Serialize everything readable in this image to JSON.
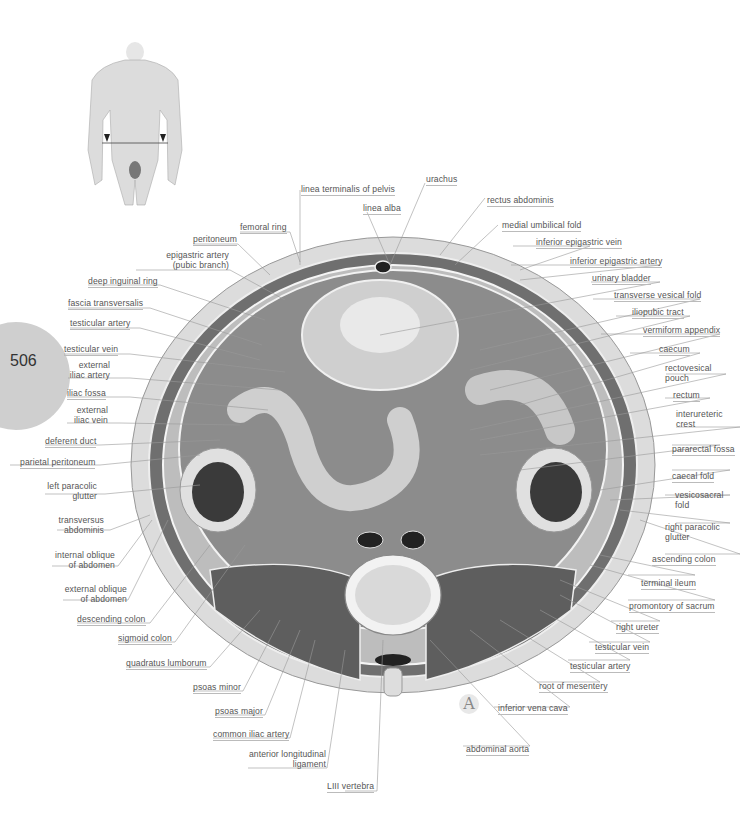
{
  "page": {
    "number": "506",
    "plate_letter": "A"
  },
  "figure": {
    "orientation_figure": "male torso with section line and arrows at lower abdomen"
  },
  "labels_left": [
    {
      "id": "femoral-ring",
      "text": "femoral ring"
    },
    {
      "id": "peritoneum",
      "text": "peritoneum"
    },
    {
      "id": "epigastric-artery",
      "text": "epigastric artery",
      "text2": "(pubic branch)"
    },
    {
      "id": "deep-inguinal-ring",
      "text": "deep inguinal ring"
    },
    {
      "id": "fascia-transversalis",
      "text": "fascia transversalis"
    },
    {
      "id": "testicular-artery-l",
      "text": "testicular artery"
    },
    {
      "id": "testicular-vein-l",
      "text": "testicular vein"
    },
    {
      "id": "external-iliac-artery",
      "text": "external",
      "text2": "iliac artery"
    },
    {
      "id": "iliac-fossa",
      "text": "iliac fossa"
    },
    {
      "id": "external-iliac-vein",
      "text": "external",
      "text2": "iliac vein"
    },
    {
      "id": "deferent-duct",
      "text": "deferent duct"
    },
    {
      "id": "parietal-peritoneum",
      "text": "parietal peritoneum"
    },
    {
      "id": "left-paracolic-glutter",
      "text": "left paracolic",
      "text2": "glutter"
    },
    {
      "id": "transversus-abdominis",
      "text": "transversus",
      "text2": "abdominis"
    },
    {
      "id": "internal-oblique",
      "text": "internal oblique",
      "text2": "of abdomen"
    },
    {
      "id": "external-oblique",
      "text": "external oblique",
      "text2": "of abdomen"
    },
    {
      "id": "descending-colon",
      "text": "descending colon"
    },
    {
      "id": "sigmoid-colon",
      "text": "sigmoid colon"
    },
    {
      "id": "quadratus-lumborum",
      "text": "quadratus lumborum"
    },
    {
      "id": "psoas-minor",
      "text": "psoas minor"
    },
    {
      "id": "psoas-major",
      "text": "psoas major"
    },
    {
      "id": "common-iliac-artery",
      "text": "common iliac artery"
    },
    {
      "id": "anterior-longitudinal-ligament",
      "text": "anterior longitudinal",
      "text2": "ligament"
    },
    {
      "id": "liii-vertebra",
      "text": "LIII vertebra"
    }
  ],
  "labels_top": [
    {
      "id": "linea-terminalis",
      "text": "linea terminalis of pelvis"
    },
    {
      "id": "urachus",
      "text": "urachus"
    },
    {
      "id": "linea-alba",
      "text": "linea alba"
    },
    {
      "id": "rectus-abdominis",
      "text": "rectus abdominis"
    },
    {
      "id": "medial-umbilical-fold",
      "text": "medial umbilical fold"
    }
  ],
  "labels_right": [
    {
      "id": "inferior-epigastric-vein",
      "text": "inferior epigastric vein"
    },
    {
      "id": "inferior-epigastric-artery",
      "text": "inferior epigastric artery"
    },
    {
      "id": "urinary-bladder",
      "text": "urinary bladder"
    },
    {
      "id": "transverse-vesical-fold",
      "text": "transverse vesical fold"
    },
    {
      "id": "iliopubic-tract",
      "text": "iliopubic tract"
    },
    {
      "id": "vermiform-appendix",
      "text": "vermiform appendix"
    },
    {
      "id": "caecum",
      "text": "caecum"
    },
    {
      "id": "rectovesical-pouch",
      "text": "rectovesical",
      "text2": "pouch"
    },
    {
      "id": "rectum",
      "text": "rectum"
    },
    {
      "id": "interureteric-crest",
      "text": "interureteric",
      "text2": "crest"
    },
    {
      "id": "pararectal-fossa",
      "text": "pararectal fossa"
    },
    {
      "id": "caecal-fold",
      "text": "caecal fold"
    },
    {
      "id": "vesicosacral-fold",
      "text": "vesicosacral",
      "text2": "fold"
    },
    {
      "id": "right-paracolic-glutter",
      "text": "right paracolic",
      "text2": "glutter"
    },
    {
      "id": "ascending-colon",
      "text": "ascending colon"
    },
    {
      "id": "terminal-ileum",
      "text": "terminal ileum"
    },
    {
      "id": "promontory-of-sacrum",
      "text": "promontory of sacrum"
    },
    {
      "id": "right-ureter",
      "text": "right ureter"
    },
    {
      "id": "testicular-vein-r",
      "text": "testicular vein"
    },
    {
      "id": "testicular-artery-r",
      "text": "testicular artery"
    },
    {
      "id": "root-of-mesentery",
      "text": "root of mesentery"
    },
    {
      "id": "inferior-vena-cava",
      "text": "inferior vena cava"
    },
    {
      "id": "abdominal-aorta",
      "text": "abdominal aorta"
    }
  ],
  "colors": {
    "page_tab": "#cfcfcf",
    "label_text": "#555555",
    "leader_line": "#999999",
    "skin": "#d8d8d8",
    "muscle": "#6b6b6b",
    "cavity": "#8a8a8a"
  }
}
